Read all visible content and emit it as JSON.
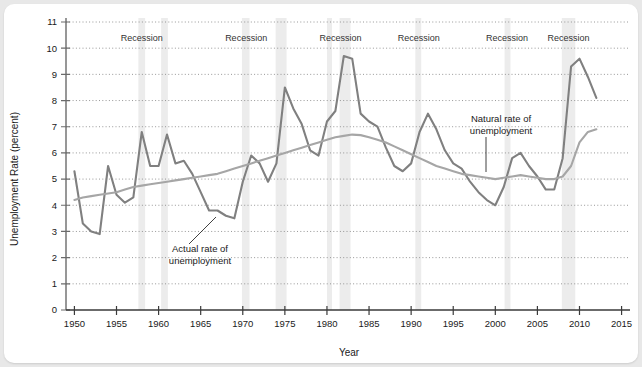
{
  "chart_data": {
    "type": "line",
    "title": "",
    "xlabel": "Year",
    "ylabel": "Unemployment Rate (percent)",
    "xlim": [
      1949,
      2016
    ],
    "ylim": [
      0,
      11
    ],
    "xticks": [
      1950,
      1955,
      1960,
      1965,
      1970,
      1975,
      1980,
      1985,
      1990,
      1995,
      2000,
      2005,
      2010,
      2015
    ],
    "yticks": [
      0,
      1,
      2,
      3,
      4,
      5,
      6,
      7,
      8,
      9,
      10,
      11
    ],
    "grid": "horizontal-dotted",
    "legend": "annotations",
    "x": [
      1950,
      1951,
      1952,
      1953,
      1954,
      1955,
      1956,
      1957,
      1958,
      1959,
      1960,
      1961,
      1962,
      1963,
      1964,
      1965,
      1966,
      1967,
      1968,
      1969,
      1970,
      1971,
      1972,
      1973,
      1974,
      1975,
      1976,
      1977,
      1978,
      1979,
      1980,
      1981,
      1982,
      1983,
      1984,
      1985,
      1986,
      1987,
      1988,
      1989,
      1990,
      1991,
      1992,
      1993,
      1994,
      1995,
      1996,
      1997,
      1998,
      1999,
      2000,
      2001,
      2002,
      2003,
      2004,
      2005,
      2006,
      2007,
      2008,
      2009,
      2010,
      2011,
      2012
    ],
    "series": [
      {
        "name": "Actual rate of unemployment",
        "color": "#808080",
        "values": [
          5.3,
          3.3,
          3.0,
          2.9,
          5.5,
          4.4,
          4.1,
          4.3,
          6.8,
          5.5,
          5.5,
          6.7,
          5.6,
          5.7,
          5.2,
          4.5,
          3.8,
          3.8,
          3.6,
          3.5,
          4.9,
          5.9,
          5.6,
          4.9,
          5.6,
          8.5,
          7.7,
          7.1,
          6.1,
          5.9,
          7.2,
          7.6,
          9.7,
          9.6,
          7.5,
          7.2,
          7.0,
          6.2,
          5.5,
          5.3,
          5.6,
          6.8,
          7.5,
          6.9,
          6.1,
          5.6,
          5.4,
          4.9,
          4.5,
          4.2,
          4.0,
          4.7,
          5.8,
          6.0,
          5.5,
          5.1,
          4.6,
          4.6,
          5.8,
          9.3,
          9.6,
          8.9,
          8.1
        ]
      },
      {
        "name": "Natural rate of unemployment",
        "color": "#a6a6a6",
        "values": [
          4.2,
          4.3,
          4.35,
          4.4,
          4.45,
          4.5,
          4.6,
          4.7,
          4.75,
          4.8,
          4.85,
          4.9,
          4.95,
          5.0,
          5.05,
          5.1,
          5.15,
          5.2,
          5.3,
          5.4,
          5.5,
          5.6,
          5.7,
          5.8,
          5.9,
          6.0,
          6.1,
          6.2,
          6.3,
          6.4,
          6.5,
          6.6,
          6.65,
          6.7,
          6.68,
          6.6,
          6.5,
          6.4,
          6.25,
          6.1,
          5.95,
          5.8,
          5.65,
          5.5,
          5.4,
          5.3,
          5.2,
          5.15,
          5.1,
          5.05,
          5.0,
          5.05,
          5.1,
          5.15,
          5.1,
          5.05,
          5.0,
          5.0,
          5.1,
          5.5,
          6.4,
          6.8,
          6.9
        ]
      }
    ],
    "recessions": [
      {
        "label": "Recession",
        "start": 1957.6,
        "end": 1958.4
      },
      {
        "label": "Recession",
        "start": 1960.3,
        "end": 1961.1
      },
      {
        "label": "Recession",
        "start": 1969.9,
        "end": 1970.8
      },
      {
        "label": "Recession",
        "start": 1973.9,
        "end": 1975.2
      },
      {
        "label": "Recession",
        "start": 1980.0,
        "end": 1980.6
      },
      {
        "label": "Recession",
        "start": 1981.5,
        "end": 1982.8
      },
      {
        "label": "Recession",
        "start": 1990.5,
        "end": 1991.2
      },
      {
        "label": "Recession",
        "start": 2001.1,
        "end": 2001.8
      },
      {
        "label": "Recession",
        "start": 2007.9,
        "end": 2009.5
      }
    ],
    "recession_labels": [
      {
        "text": "Recession",
        "x": 1958.0
      },
      {
        "text": "Recession",
        "x": 1970.4
      },
      {
        "text": "Recession",
        "x": 1981.6
      },
      {
        "text": "Recession",
        "x": 1990.9
      },
      {
        "text": "Recession",
        "x": 2001.4
      },
      {
        "text": "Recession",
        "x": 2008.7
      }
    ],
    "annotations": [
      {
        "name": "actual-rate-annotation",
        "line1": "Actual rate of",
        "line2": "unemployment",
        "text_x": 196,
        "text_y": 248,
        "leader": [
          [
            212,
            213
          ],
          [
            185,
            240
          ]
        ]
      },
      {
        "name": "natural-rate-annotation",
        "line1": "Natural rate of",
        "line2": "unemployment",
        "text_x": 497,
        "text_y": 118,
        "leader": [
          [
            482,
            133
          ],
          [
            482,
            168
          ]
        ]
      }
    ],
    "colors": {
      "actual": "#808080",
      "natural": "#a6a6a6",
      "recession_band": "#ececec",
      "axis": "#6b6b6b",
      "grid": "#8c8c8c",
      "card": "#ffffff",
      "page": "#e8e8e8"
    }
  }
}
